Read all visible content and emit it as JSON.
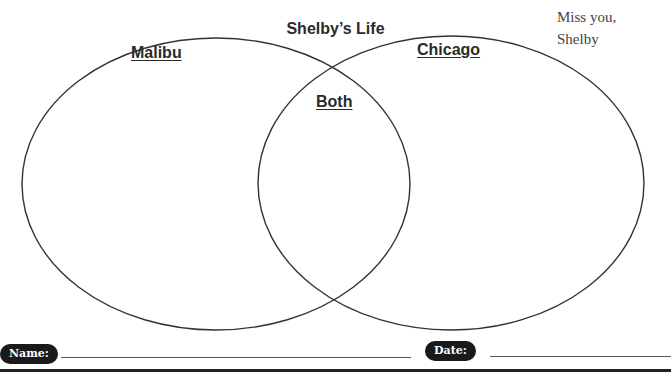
{
  "diagram": {
    "title": "Shelby’s Life",
    "sets": [
      {
        "label": "Malibu",
        "cx": 216,
        "cy": 184,
        "rx": 194,
        "ry": 146
      },
      {
        "label": "Chicago",
        "cx": 451,
        "cy": 183,
        "rx": 193,
        "ry": 147
      }
    ],
    "intersection_label": "Both",
    "stroke_color": "#333333"
  },
  "note": {
    "line1": "Miss you,",
    "line2": "Shelby"
  },
  "footer": {
    "name_label": "Name:",
    "date_label": "Date:"
  }
}
